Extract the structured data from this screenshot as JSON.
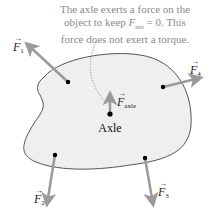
{
  "caption": {
    "line1": "The axle exerts a force on the",
    "line2_prefix": "object to keep ",
    "line2_symbol": "F",
    "line2_sub": "net",
    "line2_suffix": " = 0. This",
    "line3": "force does not exert a torque."
  },
  "forces": [
    {
      "id": "F1",
      "symbol": "F",
      "sub": "1"
    },
    {
      "id": "F2",
      "symbol": "F",
      "sub": "2"
    },
    {
      "id": "F3",
      "symbol": "F",
      "sub": "3"
    },
    {
      "id": "F4",
      "symbol": "F",
      "sub": "4"
    },
    {
      "id": "Faxle",
      "symbol": "F",
      "sub": "axle"
    }
  ],
  "axle_label": "Axle",
  "colors": {
    "body_fill": "#efefef",
    "body_stroke": "#555555",
    "arrow": "#9a9a9a",
    "caption_text": "#8a8a8a",
    "dot": "#000000"
  }
}
